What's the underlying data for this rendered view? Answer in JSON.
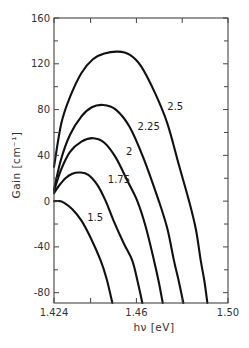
{
  "chart_data": {
    "type": "line",
    "title": "",
    "xlabel": "hν  [eV]",
    "ylabel": "Gain  [cm⁻¹]",
    "xlim": [
      1.424,
      1.5
    ],
    "ylim": [
      -89,
      160
    ],
    "grid": false,
    "legend": "none (inline curve labels)",
    "x_ticks": [
      {
        "value": 1.424,
        "label": "1.424"
      },
      {
        "value": 1.46,
        "label": "1.46"
      },
      {
        "value": 1.5,
        "label": "1.50"
      }
    ],
    "x_minor_ticks": [
      1.44,
      1.48
    ],
    "y_ticks": [
      {
        "value": 160,
        "label": "160"
      },
      {
        "value": 120,
        "label": "120"
      },
      {
        "value": 80,
        "label": "80"
      },
      {
        "value": 40,
        "label": "40"
      },
      {
        "value": 0,
        "label": "0"
      },
      {
        "value": -40,
        "label": "-40"
      },
      {
        "value": -80,
        "label": "-80"
      }
    ],
    "y_minor_ticks": [
      140,
      100,
      60,
      20,
      -20,
      -60
    ],
    "series": [
      {
        "name": "1.5",
        "label_pos": [
          1.4385,
          -17
        ],
        "points": [
          [
            1.424,
            0
          ],
          [
            1.4265,
            0
          ],
          [
            1.428,
            -1
          ],
          [
            1.432,
            -7
          ],
          [
            1.436,
            -17
          ],
          [
            1.44,
            -32
          ],
          [
            1.4444,
            -52
          ],
          [
            1.447,
            -68
          ],
          [
            1.4495,
            -89
          ]
        ]
      },
      {
        "name": "1.75",
        "label_pos": [
          1.4475,
          16
        ],
        "points": [
          [
            1.424,
            7
          ],
          [
            1.426,
            13
          ],
          [
            1.429,
            20
          ],
          [
            1.432,
            24
          ],
          [
            1.4354,
            25
          ],
          [
            1.439,
            23
          ],
          [
            1.443,
            14
          ],
          [
            1.4466,
            0
          ],
          [
            1.45,
            -17
          ],
          [
            1.4545,
            -37
          ],
          [
            1.4582,
            -52
          ],
          [
            1.4605,
            -70
          ],
          [
            1.4626,
            -89
          ]
        ]
      },
      {
        "name": "2",
        "label_pos": [
          1.4555,
          40
        ],
        "points": [
          [
            1.424,
            9
          ],
          [
            1.427,
            27
          ],
          [
            1.431,
            43
          ],
          [
            1.436,
            52
          ],
          [
            1.4412,
            55
          ],
          [
            1.446,
            51
          ],
          [
            1.451,
            38
          ],
          [
            1.456,
            18
          ],
          [
            1.4604,
            0
          ],
          [
            1.464,
            -22
          ],
          [
            1.4677,
            -52
          ],
          [
            1.4697,
            -70
          ],
          [
            1.4715,
            -89
          ]
        ]
      },
      {
        "name": "2.25",
        "label_pos": [
          1.4605,
          62
        ],
        "points": [
          [
            1.424,
            10
          ],
          [
            1.427,
            36
          ],
          [
            1.431,
            58
          ],
          [
            1.436,
            74
          ],
          [
            1.4405,
            82
          ],
          [
            1.4455,
            84
          ],
          [
            1.451,
            80
          ],
          [
            1.457,
            65
          ],
          [
            1.463,
            38
          ],
          [
            1.4698,
            0
          ],
          [
            1.4735,
            -24
          ],
          [
            1.4764,
            -52
          ],
          [
            1.4785,
            -70
          ],
          [
            1.4805,
            -89
          ]
        ]
      },
      {
        "name": "2.5",
        "label_pos": [
          1.4735,
          80
        ],
        "points": [
          [
            1.424,
            30
          ],
          [
            1.4272,
            68
          ],
          [
            1.431,
            91
          ],
          [
            1.436,
            112
          ],
          [
            1.441,
            124
          ],
          [
            1.446,
            129
          ],
          [
            1.452,
            130.6
          ],
          [
            1.457,
            128
          ],
          [
            1.462,
            118
          ],
          [
            1.468,
            95
          ],
          [
            1.4735,
            68
          ],
          [
            1.4785,
            32
          ],
          [
            1.483,
            0
          ],
          [
            1.486,
            -25
          ],
          [
            1.4881,
            -52
          ],
          [
            1.4897,
            -70
          ],
          [
            1.491,
            -89
          ]
        ]
      }
    ]
  },
  "plot_area_px": {
    "left": 54,
    "right": 228,
    "top": 18,
    "bottom": 303
  }
}
